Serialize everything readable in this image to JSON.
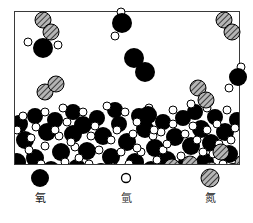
{
  "diagram": {
    "container": {
      "border_color": "#3a3a3a",
      "background": "#ffffff",
      "liquid_level_label": "liquid surface"
    },
    "colors": {
      "oxygen": "#000000",
      "hydrogen": "#ffffff",
      "nitrogen": "#9a9a9a",
      "outline": "#000000"
    },
    "phases": {
      "gas_label": "gas phase",
      "liquid_label": "liquid phase"
    }
  },
  "legend": {
    "items": [
      {
        "name": "oxygen",
        "label": "氧",
        "style": "solid-black",
        "color": "#000000",
        "radius": 9
      },
      {
        "name": "hydrogen",
        "label": "氫",
        "style": "open-white",
        "color": "#ffffff",
        "radius": 4
      },
      {
        "name": "nitrogen",
        "label": "氮",
        "style": "hatched-gray",
        "color": "#9a9a9a",
        "radius": 9
      }
    ]
  },
  "molecules": {
    "gas_water": [
      {
        "ox": 40,
        "oy": 43,
        "h1x": 25,
        "h1y": 37,
        "h2x": 56,
        "h2y": 40
      },
      {
        "ox": 119,
        "oy": 19,
        "h1x": 112,
        "h1y": 33,
        "h2x": 117,
        "h2y": 5
      },
      {
        "ox": 149,
        "oy": 113,
        "h1x": 135,
        "h1y": 118,
        "h2x": 152,
        "h2y": 126
      },
      {
        "ox": 235,
        "oy": 72,
        "h1x": 228,
        "h1y": 85,
        "h2x": 243,
        "h2y": 63
      }
    ],
    "gas_oxygen": [
      {
        "x1": 132,
        "y1": 55,
        "x2": 142,
        "y2": 68
      }
    ],
    "gas_nitrogen": [
      {
        "x1": 28,
        "y1": 10,
        "x2": 36,
        "y2": 22
      },
      {
        "x1": 43,
        "y1": 85,
        "x2": 53,
        "y2": 78
      },
      {
        "x1": 196,
        "y1": 84,
        "x2": 203,
        "y2": 95
      },
      {
        "x1": 222,
        "y1": 17,
        "x2": 230,
        "y2": 27
      }
    ],
    "liquid_nitrogen": [
      {
        "x": 157,
        "y": 155
      },
      {
        "x": 175,
        "y": 152
      },
      {
        "x": 206,
        "y": 140
      },
      {
        "x": 228,
        "y": 151
      },
      {
        "x": 196,
        "y": 157
      }
    ],
    "liquid_oxygen_count": 42,
    "liquid_hydrogen_count": 70
  }
}
